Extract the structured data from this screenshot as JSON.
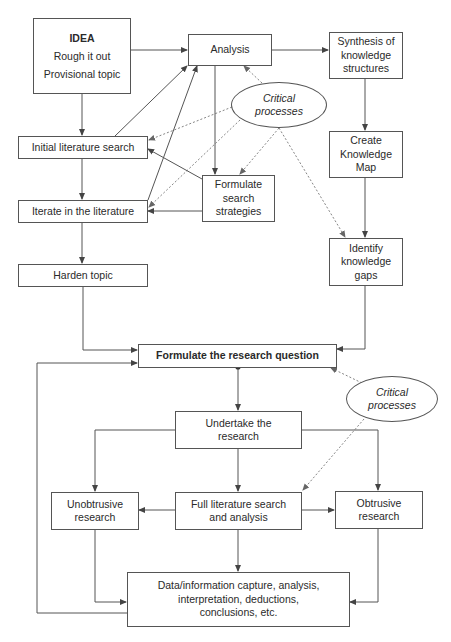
{
  "diagram": {
    "type": "flowchart",
    "nodes": {
      "idea": {
        "title": "IDEA",
        "line2": "Rough it out",
        "line3": "Provisional topic"
      },
      "analysis": {
        "label": "Analysis"
      },
      "synthesis": {
        "line1": "Synthesis of",
        "line2": "knowledge",
        "line3": "structures"
      },
      "critical_top": {
        "line1": "Critical",
        "line2": "processes"
      },
      "initial_search": {
        "label": "Initial literature search"
      },
      "knowledge_map": {
        "line1": "Create",
        "line2": "Knowledge",
        "line3": "Map"
      },
      "search_strategies": {
        "line1": "Formulate",
        "line2": "search",
        "line3": "strategies"
      },
      "iterate": {
        "label": "Iterate in the literature"
      },
      "harden": {
        "label": "Harden topic"
      },
      "knowledge_gaps": {
        "line1": "Identify",
        "line2": "knowledge",
        "line3": "gaps"
      },
      "research_question": {
        "label": "Formulate the research question"
      },
      "critical_bottom": {
        "line1": "Critical",
        "line2": "processes"
      },
      "undertake": {
        "line1": "Undertake the",
        "line2": "research"
      },
      "unobtrusive": {
        "line1": "Unobtrusive",
        "line2": "research"
      },
      "full_search": {
        "line1": "Full literature search",
        "line2": "and analysis"
      },
      "obtrusive": {
        "line1": "Obtrusive",
        "line2": "research"
      },
      "data_capture": {
        "line1": "Data/information capture, analysis,",
        "line2": "interpretation, deductions,",
        "line3": "conclusions, etc."
      }
    },
    "edges": [
      {
        "from": "IDEA",
        "to": "Analysis",
        "style": "solid"
      },
      {
        "from": "IDEA",
        "to": "Initial literature search",
        "style": "solid"
      },
      {
        "from": "Analysis",
        "to": "Synthesis of knowledge structures",
        "style": "solid"
      },
      {
        "from": "Analysis",
        "to": "Formulate search strategies",
        "style": "solid"
      },
      {
        "from": "Initial literature search",
        "to": "Analysis",
        "style": "solid"
      },
      {
        "from": "Iterate in the literature",
        "to": "Analysis",
        "style": "solid"
      },
      {
        "from": "Initial literature search",
        "to": "Iterate in the literature",
        "style": "solid"
      },
      {
        "from": "Formulate search strategies",
        "to": "Initial literature search",
        "style": "solid"
      },
      {
        "from": "Formulate search strategies",
        "to": "Iterate in the literature",
        "style": "solid"
      },
      {
        "from": "Iterate in the literature",
        "to": "Harden topic",
        "style": "solid"
      },
      {
        "from": "Synthesis of knowledge structures",
        "to": "Create Knowledge Map",
        "style": "solid"
      },
      {
        "from": "Create Knowledge Map",
        "to": "Identify knowledge gaps",
        "style": "solid"
      },
      {
        "from": "Harden topic",
        "to": "Formulate the research question",
        "style": "solid"
      },
      {
        "from": "Identify knowledge gaps",
        "to": "Formulate the research question",
        "style": "solid"
      },
      {
        "from": "Critical processes (top)",
        "to": "Analysis",
        "style": "dotted"
      },
      {
        "from": "Critical processes (top)",
        "to": "Initial literature search",
        "style": "dotted"
      },
      {
        "from": "Critical processes (top)",
        "to": "Iterate in the literature",
        "style": "dotted"
      },
      {
        "from": "Critical processes (top)",
        "to": "Formulate search strategies",
        "style": "dotted"
      },
      {
        "from": "Critical processes (top)",
        "to": "Identify knowledge gaps",
        "style": "dotted"
      },
      {
        "from": "Formulate the research question",
        "to": "Undertake the research",
        "style": "solid"
      },
      {
        "from": "Critical processes (bottom)",
        "to": "Formulate the research question",
        "style": "dotted"
      },
      {
        "from": "Critical processes (bottom)",
        "to": "Full literature search and analysis",
        "style": "dotted"
      },
      {
        "from": "Undertake the research",
        "to": "Unobtrusive research",
        "style": "solid"
      },
      {
        "from": "Undertake the research",
        "to": "Full literature search and analysis",
        "style": "solid"
      },
      {
        "from": "Undertake the research",
        "to": "Obtrusive research",
        "style": "solid"
      },
      {
        "from": "Full literature search and analysis",
        "to": "Unobtrusive research",
        "style": "solid"
      },
      {
        "from": "Full literature search and analysis",
        "to": "Obtrusive research",
        "style": "solid"
      },
      {
        "from": "Unobtrusive research",
        "to": "Data/information capture",
        "style": "solid"
      },
      {
        "from": "Full literature search and analysis",
        "to": "Data/information capture",
        "style": "solid"
      },
      {
        "from": "Obtrusive research",
        "to": "Data/information capture",
        "style": "solid"
      },
      {
        "from": "Data/information capture",
        "to": "Formulate the research question",
        "style": "solid"
      }
    ],
    "colors": {
      "line": "#555555",
      "text": "#2a2a2a",
      "background": "#ffffff"
    }
  }
}
